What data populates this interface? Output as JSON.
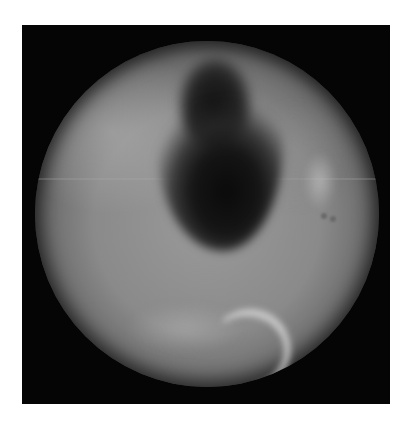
{
  "image": {
    "description": "Grayscale circular endoscopic view inside a black square frame",
    "colors": {
      "background": "#ffffff",
      "frame": "#050505",
      "tissue": "#8a8a8a",
      "cavity": "#0a0a0a",
      "highlight": "#d7d7d7"
    }
  }
}
